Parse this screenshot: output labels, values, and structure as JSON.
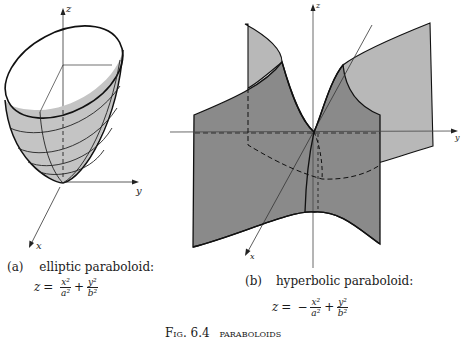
{
  "figure": {
    "caption_label": "Fig. 6.4",
    "caption_text": "paraboloids",
    "panels": [
      {
        "tag": "(a)",
        "name": "elliptic paraboloid:",
        "equation": {
          "lhs": "z",
          "eq": "=",
          "term1_sign": "",
          "term1_num": "x²",
          "term1_den": "a²",
          "op": "+",
          "term2_num": "y²",
          "term2_den": "b²"
        },
        "axes": {
          "x": "x",
          "y": "y",
          "z": "z"
        }
      },
      {
        "tag": "(b)",
        "name": "hyperbolic paraboloid:",
        "equation": {
          "lhs": "z",
          "eq": "=",
          "term1_sign": "−",
          "term1_num": "x²",
          "term1_den": "a²",
          "op": "+",
          "term2_num": "y²",
          "term2_den": "b²"
        },
        "axes": {
          "x": "x",
          "y": "y",
          "z": "z"
        }
      }
    ],
    "colors": {
      "elliptic_fill": "#c4c4c4",
      "hyperbolic_dark": "#8a8a8a",
      "hyperbolic_light": "#b8b8b8",
      "line": "#1a1a1a"
    }
  }
}
